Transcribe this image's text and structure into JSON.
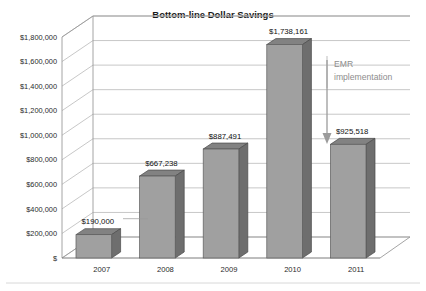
{
  "chart_data": {
    "type": "bar",
    "title": "Bottom-line Dollar Savings",
    "xlabel": "",
    "ylabel": "",
    "categories": [
      "2007",
      "2008",
      "2009",
      "2010",
      "2011"
    ],
    "values": [
      190000,
      667238,
      887491,
      1738161,
      925518
    ],
    "data_labels": [
      "$190,000",
      "$667,238",
      "$887,491",
      "$1,738,161",
      "$925,518"
    ],
    "ylim": [
      0,
      1800000
    ],
    "ytick_values": [
      0,
      200000,
      400000,
      600000,
      800000,
      1000000,
      1200000,
      1400000,
      1600000,
      1800000
    ],
    "ytick_labels": [
      "$",
      "$200,000",
      "$400,000",
      "$600,000",
      "$800,000",
      "$1,000,000",
      "$1,200,000",
      "$1,400,000",
      "$1,600,000",
      "$1,800,000"
    ],
    "grid": true,
    "legend": "none",
    "style": "3d-column",
    "annotations": [
      {
        "name": "emr-implementation",
        "text_line1": "EMR",
        "text_line2": "implementation",
        "marker": "down-arrow",
        "points_to_category": "2011"
      }
    ],
    "colors": {
      "bar_front": "#a0a0a0",
      "bar_side": "#6e6e6e",
      "bar_top": "#828282",
      "gridline": "#b9b9b9",
      "annotation_text": "#8d8d8d",
      "title_text": "#1a1a1a",
      "background": "#ffffff"
    }
  }
}
